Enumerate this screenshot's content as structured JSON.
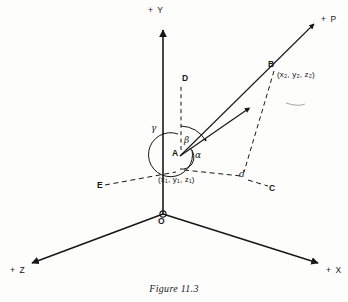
{
  "figure": {
    "caption": "Figure 11.3"
  },
  "axes": {
    "y_label": "+ Y",
    "x_label": "+ X",
    "z_label": "+ Z",
    "p_label": "+ P",
    "origin_label": "O"
  },
  "points": {
    "a_label": "A",
    "a_coord": "(x₁, y₁, z₁)",
    "b_label": "B",
    "b_coord": "(x₂, y₂, z₂)",
    "c_label": "C",
    "d_label": "D",
    "e_label": "E",
    "foot_label": "d"
  },
  "angles": {
    "alpha": "α",
    "beta": "β",
    "gamma": "γ"
  },
  "colors": {
    "ink": "#17171a",
    "paper": "#fdfdfb"
  }
}
